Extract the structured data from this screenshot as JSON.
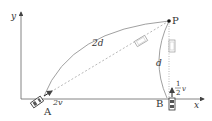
{
  "diagram": {
    "axes": {
      "x_label": "x",
      "y_label": "y"
    },
    "points": {
      "A": {
        "label": "A",
        "velocity": "2v"
      },
      "B": {
        "label": "B",
        "velocity_num": "1",
        "velocity_den": "2",
        "velocity_var": "v"
      },
      "P": {
        "label": "P"
      }
    },
    "distances": {
      "AP_arc": "2d",
      "BP_arc": "d"
    },
    "colors": {
      "axis": "#555555",
      "path": "#888888",
      "dashed": "#999999",
      "point": "#111111"
    }
  }
}
